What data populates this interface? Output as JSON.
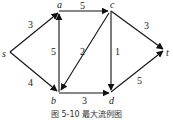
{
  "figure": {
    "caption": "图 5-10   最大流例图",
    "nodes": [
      {
        "id": "s",
        "label": "s",
        "x": 10,
        "y": 52
      },
      {
        "id": "a",
        "label": "a",
        "x": 59,
        "y": 12
      },
      {
        "id": "c",
        "label": "c",
        "x": 110,
        "y": 11
      },
      {
        "id": "t",
        "label": "t",
        "x": 165,
        "y": 50
      },
      {
        "id": "b",
        "label": "b",
        "x": 59,
        "y": 92
      },
      {
        "id": "d",
        "label": "d",
        "x": 111,
        "y": 92
      }
    ],
    "edges": [
      {
        "from": "s",
        "to": "a",
        "capacity": "3"
      },
      {
        "from": "s",
        "to": "b",
        "capacity": "4"
      },
      {
        "from": "b",
        "to": "a",
        "capacity": "5"
      },
      {
        "from": "a",
        "to": "c",
        "capacity": "5"
      },
      {
        "from": "c",
        "to": "b",
        "capacity": "2"
      },
      {
        "from": "c",
        "to": "d",
        "capacity": "1"
      },
      {
        "from": "c",
        "to": "t",
        "capacity": "3"
      },
      {
        "from": "b",
        "to": "d",
        "capacity": "3"
      },
      {
        "from": "d",
        "to": "t",
        "capacity": "5"
      }
    ]
  }
}
